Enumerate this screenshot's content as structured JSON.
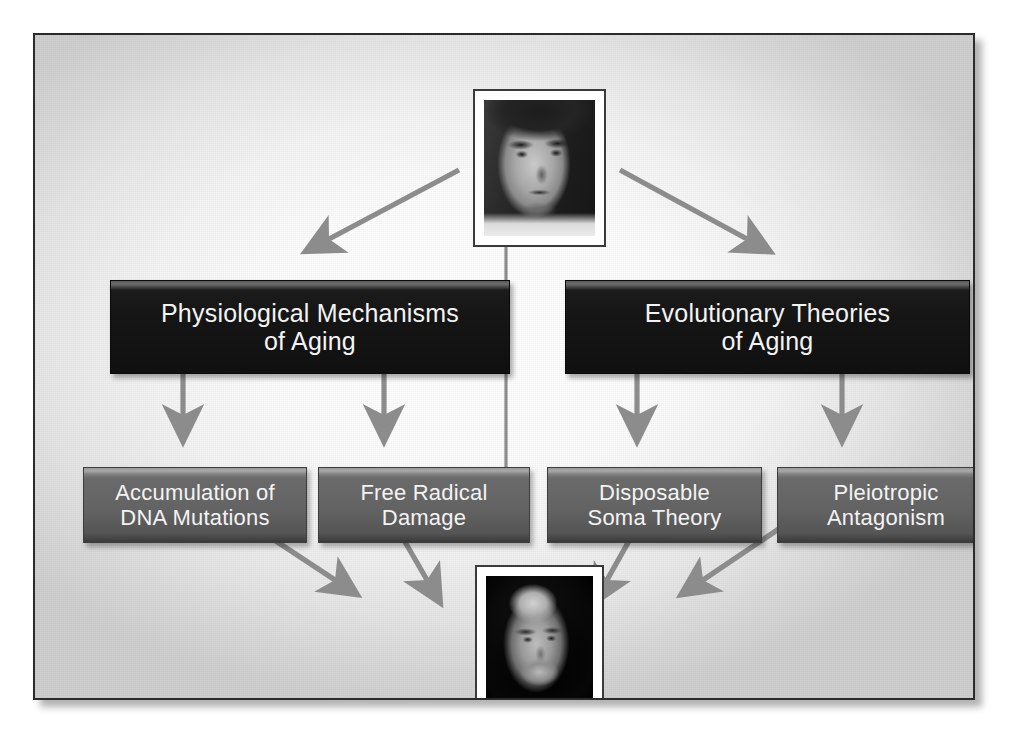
{
  "figure": {
    "background_color": "#f2f2f2",
    "frame_border_color": "#2b2b2b",
    "arrow_color": "#8c8c8c",
    "dark_box_color": "#151515",
    "gray_box_color": "#636363",
    "box_text_color": "#f3f3f3"
  },
  "photos": {
    "top": {
      "caption": "",
      "alt": "black and white portrait of a dark-haired man in a white shirt",
      "frame_color": "#ffffff"
    },
    "bottom": {
      "caption": "",
      "alt": "black and white portrait of the same man, older, bald with a grey beard",
      "frame_color": "#ffffff"
    }
  },
  "nodes": {
    "level1": [
      {
        "id": "physiological-mechanisms",
        "label": "Physiological Mechanisms\nof Aging",
        "style": "dark"
      },
      {
        "id": "evolutionary-theories",
        "label": "Evolutionary Theories\nof Aging",
        "style": "dark"
      }
    ],
    "level2": [
      {
        "id": "accumulation-dna-mutations",
        "label": "Accumulation of\nDNA Mutations",
        "style": "gray",
        "parent": "physiological-mechanisms"
      },
      {
        "id": "free-radical-damage",
        "label": "Free Radical\nDamage",
        "style": "gray",
        "parent": "physiological-mechanisms"
      },
      {
        "id": "disposable-soma-theory",
        "label": "Disposable\nSoma Theory",
        "style": "gray",
        "parent": "evolutionary-theories"
      },
      {
        "id": "pleiotropic-antagonism",
        "label": "Pleiotropic\nAntagonism",
        "style": "gray",
        "parent": "evolutionary-theories"
      }
    ]
  },
  "connectors": [
    {
      "id": "top-photo-to-physiological",
      "kind": "arrow",
      "direction": "down-left"
    },
    {
      "id": "top-photo-to-evolutionary",
      "kind": "arrow",
      "direction": "down-right"
    },
    {
      "id": "physiological-to-dna",
      "kind": "arrow",
      "direction": "down"
    },
    {
      "id": "physiological-to-free-radical",
      "kind": "arrow",
      "direction": "down"
    },
    {
      "id": "evolutionary-to-soma",
      "kind": "arrow",
      "direction": "down"
    },
    {
      "id": "evolutionary-to-pleiotropic",
      "kind": "arrow",
      "direction": "down"
    },
    {
      "id": "dna-to-bottom-photo",
      "kind": "arrow",
      "direction": "down-right"
    },
    {
      "id": "free-radical-to-bottom-photo",
      "kind": "arrow",
      "direction": "down-right"
    },
    {
      "id": "soma-to-bottom-photo",
      "kind": "arrow",
      "direction": "down-left"
    },
    {
      "id": "pleiotropic-to-bottom-photo",
      "kind": "arrow",
      "direction": "down-left"
    },
    {
      "id": "top-photo-to-bottom-photo",
      "kind": "line",
      "direction": "down"
    }
  ]
}
